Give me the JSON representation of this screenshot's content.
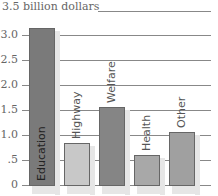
{
  "chart_data": {
    "type": "bar",
    "title": "3.5 billion dollars",
    "xlabel": "",
    "ylabel": "billion dollars",
    "ylim": [
      0,
      3.5
    ],
    "yticks": [
      "0",
      ".5",
      "1.0",
      "1.5",
      "2.0",
      "2.5",
      "3.0",
      "3.5"
    ],
    "categories": [
      "Education",
      "Highway",
      "Welfare",
      "Health",
      "Other"
    ],
    "values": [
      3.15,
      0.84,
      1.56,
      0.6,
      1.06
    ],
    "colors": [
      "#7a7a7a",
      "#c8c8c8",
      "#858585",
      "#a8a8a8",
      "#a0a0a0"
    ],
    "grid": true,
    "legend": null
  }
}
